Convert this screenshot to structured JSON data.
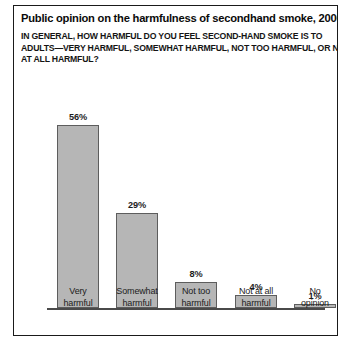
{
  "figure": {
    "title": "Public opinion on the harmfulness of secondhand smoke, 2006",
    "subtitle_lines": [
      "IN GENERAL, HOW HARMFUL DO YOU FEEL SECOND-HAND SMOKE IS TO",
      "ADULTS—VERY HARMFUL, SOMEWHAT HARMFUL, NOT TOO HARMFUL, OR NOT",
      "AT ALL HARMFUL?"
    ]
  },
  "chart_data": {
    "type": "bar",
    "title": "Public opinion on the harmfulness of secondhand smoke, 2006",
    "subtitle": "IN GENERAL, HOW HARMFUL DO YOU FEEL SECOND-HAND SMOKE IS TO ADULTS—VERY HARMFUL, SOMEWHAT HARMFUL, NOT TOO HARMFUL, OR NOT AT ALL HARMFUL?",
    "categories": [
      "Very harmful",
      "Somewhat harmful",
      "Not too harmful",
      "Not at all harmful",
      "No opinion"
    ],
    "category_lines": [
      [
        "Very",
        "harmful"
      ],
      [
        "Somewhat",
        "harmful"
      ],
      [
        "Not too",
        "harmful"
      ],
      [
        "Not at all",
        "harmful"
      ],
      [
        "No",
        "opinion"
      ]
    ],
    "values": [
      56,
      29,
      8,
      4,
      1
    ],
    "value_labels": [
      "56%",
      "29%",
      "8%",
      "4%",
      "1%"
    ],
    "xlabel": "",
    "ylabel": "",
    "ylim": [
      0,
      60
    ],
    "grid": false,
    "legend": false,
    "bar_color": "#b6b6b6",
    "bar_border_color": "#5d5d5d",
    "axis_color": "#4a4a4a",
    "text_color": "#1c1c1c"
  }
}
